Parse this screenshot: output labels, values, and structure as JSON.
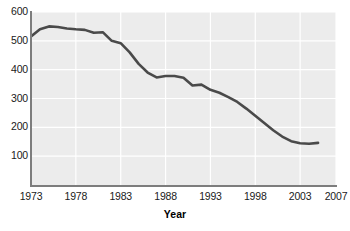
{
  "chart_data": {
    "type": "line",
    "title": "",
    "subtitle": "",
    "xlabel": "Year",
    "ylabel": "",
    "xlim": [
      1973,
      2007
    ],
    "ylim": [
      0,
      600
    ],
    "grid": true,
    "legend": null,
    "xticks": [
      "1973",
      "1978",
      "1983",
      "1988",
      "1993",
      "1998",
      "2003",
      "2007"
    ],
    "xtick_values": [
      1973,
      1978,
      1983,
      1988,
      1993,
      1998,
      2003,
      2007
    ],
    "yticks": [
      "600",
      "500",
      "400",
      "300",
      "200",
      "100"
    ],
    "ytick_values": [
      600,
      500,
      400,
      300,
      200,
      100
    ],
    "series": [
      {
        "name": "value",
        "color": "#4a4a4a",
        "x": [
          1973,
          1974,
          1975,
          1976,
          1977,
          1978,
          1979,
          1980,
          1981,
          1982,
          1983,
          1984,
          1985,
          1986,
          1987,
          1988,
          1989,
          1990,
          1991,
          1992,
          1993,
          1994,
          1995,
          1996,
          1997,
          1998,
          1999,
          2000,
          2001,
          2002,
          2003,
          2004,
          2005
        ],
        "values": [
          515,
          540,
          550,
          548,
          543,
          540,
          538,
          528,
          530,
          500,
          492,
          460,
          420,
          390,
          373,
          378,
          378,
          372,
          345,
          348,
          330,
          320,
          305,
          288,
          265,
          240,
          215,
          190,
          168,
          152,
          145,
          143,
          146
        ]
      }
    ],
    "colors": {
      "line": "#4a4a4a",
      "plot_background": "#ececec",
      "gridline": "#ffffff",
      "axis": "#7d7d7d",
      "text": "#1a1a1a"
    }
  }
}
